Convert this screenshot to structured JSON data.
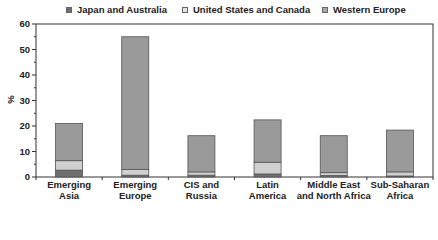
{
  "chart_data": {
    "type": "bar",
    "stacked": true,
    "title": "",
    "xlabel": "",
    "ylabel": "%",
    "ylim": [
      0,
      60
    ],
    "yticks": [
      0,
      10,
      20,
      30,
      40,
      50,
      60
    ],
    "grid": false,
    "legend_position": "top",
    "categories": [
      "Emerging Asia",
      "Emerging Europe",
      "CIS and Russia",
      "Latin America",
      "Middle East and North Africa",
      "Sub-Saharan Africa"
    ],
    "category_labels": [
      [
        "Emerging",
        "Asia"
      ],
      [
        "Emerging",
        "Europe"
      ],
      [
        "CIS and",
        "Russia"
      ],
      [
        "Latin",
        "America"
      ],
      [
        "Middle East",
        "and North Africa"
      ],
      [
        "Sub-Saharan",
        "Africa"
      ]
    ],
    "series": [
      {
        "name": "Japan and Australia",
        "color": "#6e6e6e",
        "values": [
          2.7,
          0.7,
          0.7,
          1.2,
          0.6,
          0.4
        ]
      },
      {
        "name": "United States and Canada",
        "color": "#d0d0d0",
        "values": [
          3.7,
          2.3,
          1.3,
          4.6,
          1.1,
          1.6
        ]
      },
      {
        "name": "Western Europe",
        "color": "#9a9a9a",
        "values": [
          14.6,
          52.0,
          14.2,
          16.6,
          14.5,
          16.4
        ]
      }
    ],
    "totals": [
      21.0,
      55.0,
      16.2,
      22.4,
      16.2,
      18.4
    ]
  }
}
